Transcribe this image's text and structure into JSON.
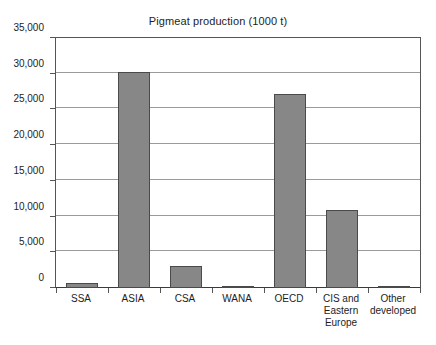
{
  "chart_data": {
    "type": "bar",
    "title": "Pigmeat production (1000 t)",
    "xlabel": "",
    "ylabel": "",
    "ylim": [
      0,
      35000
    ],
    "ytick_values": [
      0,
      5000,
      10000,
      15000,
      20000,
      25000,
      30000,
      35000
    ],
    "ytick_labels": [
      "0",
      "5,000",
      "10,000",
      "15,000",
      "20,000",
      "25,000",
      "30,000",
      "35,000"
    ],
    "grid": true,
    "legend": "none",
    "categories": [
      "SSA",
      "ASIA",
      "CSA",
      "WANA",
      "OECD",
      "CIS and Eastern Europe",
      "Other developed"
    ],
    "values": [
      650,
      30200,
      3050,
      60,
      27200,
      10900,
      250
    ],
    "bar_color": "#878787",
    "bar_edge_color": "#4a4a4a",
    "axis_color": "#555555",
    "gridline_color": "#9a9a9a",
    "background_color": "#ffffff",
    "text_color": "#1d1d1d"
  }
}
